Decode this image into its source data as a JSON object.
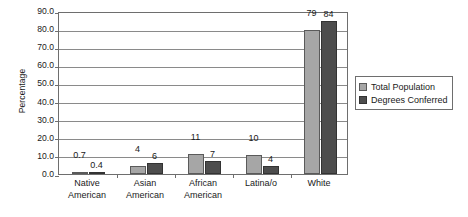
{
  "chart_data": {
    "type": "bar",
    "title": "",
    "subtitle": "",
    "xlabel": "",
    "ylabel": "Percentage",
    "ylim": [
      0,
      90
    ],
    "ytick_step": 10,
    "ytick_labels": [
      "0.0",
      "10.0",
      "20.0",
      "30.0",
      "40.0",
      "50.0",
      "60.0",
      "70.0",
      "80.0",
      "90.0"
    ],
    "ytick_values": [
      0,
      10,
      20,
      30,
      40,
      50,
      60,
      70,
      80,
      90
    ],
    "grid": true,
    "grid_axis": "y",
    "legend_position": "right",
    "categories": [
      "Native American",
      "Asian American",
      "African American",
      "Latina/o",
      "White"
    ],
    "category_lines": [
      [
        "Native",
        "American"
      ],
      [
        "Asian",
        "American"
      ],
      [
        "African",
        "American"
      ],
      [
        "Latina/o"
      ],
      [
        "White"
      ]
    ],
    "series": [
      {
        "name": "Total  Population",
        "color": "#a6a6a6",
        "values": [
          0.7,
          4,
          11,
          10,
          79
        ],
        "labels": [
          "0.7",
          "4",
          "11",
          "10",
          "79"
        ]
      },
      {
        "name": "Degrees Conferred",
        "color": "#4d4d4d",
        "values": [
          0.4,
          6,
          7,
          4,
          84
        ],
        "labels": [
          "0.4",
          "6",
          "7",
          "4",
          "84"
        ]
      }
    ]
  },
  "legend": {
    "entries": [
      {
        "label": "Total  Population",
        "color": "#a6a6a6"
      },
      {
        "label": "Degrees Conferred",
        "color": "#4d4d4d"
      }
    ]
  },
  "colors": {
    "series_light": "#a6a6a6",
    "series_dark": "#4d4d4d",
    "axis": "#6e6e6e",
    "gridline": "#8a8a8a",
    "text": "#1a1a1a",
    "background": "#ffffff"
  }
}
